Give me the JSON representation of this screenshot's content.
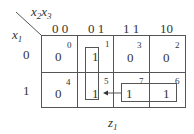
{
  "kmap": {
    "row_var": "x",
    "row_var_sub": "1",
    "col_var_a": "x",
    "col_var_a_sub": "2",
    "col_var_b": "x",
    "col_var_b_sub": "3",
    "col_headers": [
      "0 0",
      "0 1",
      "1 1",
      "10"
    ],
    "row_headers": [
      "0",
      "1"
    ],
    "cells": [
      {
        "row": 0,
        "col": 0,
        "value": "0",
        "index": "0"
      },
      {
        "row": 0,
        "col": 1,
        "value": "1",
        "index": "1"
      },
      {
        "row": 0,
        "col": 2,
        "value": "0",
        "index": "3"
      },
      {
        "row": 0,
        "col": 3,
        "value": "0",
        "index": "2"
      },
      {
        "row": 1,
        "col": 0,
        "value": "0",
        "index": "4"
      },
      {
        "row": 1,
        "col": 1,
        "value": "1",
        "index": "5"
      },
      {
        "row": 1,
        "col": 2,
        "value": "1",
        "index": "7"
      },
      {
        "row": 1,
        "col": 3,
        "value": "1",
        "index": "6"
      }
    ],
    "groups": [
      {
        "name": "vertical-group",
        "cells": [
          "1",
          "5"
        ]
      },
      {
        "name": "horizontal-group",
        "cells": [
          "7",
          "6"
        ]
      }
    ],
    "arrow": {
      "from": "7",
      "to": "5"
    },
    "caption": "z",
    "caption_sub": "1",
    "line_color": "#555555"
  }
}
